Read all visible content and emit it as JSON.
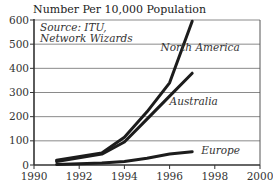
{
  "chart_data": {
    "type": "line",
    "title": "Number Per 10,000 Population",
    "source_note": [
      "Source: ITU,",
      "Network Wizards"
    ],
    "xlabel": "",
    "ylabel": "Number Per 10,000 Population",
    "xlim": [
      1990,
      2000
    ],
    "ylim": [
      0,
      600
    ],
    "x_ticks": [
      1990,
      1992,
      1994,
      1996,
      1998,
      2000
    ],
    "y_ticks": [
      0,
      100,
      200,
      300,
      400,
      500,
      600
    ],
    "grid": "horizontal",
    "legend": "inline labels",
    "series": [
      {
        "name": "North America",
        "x": [
          1991,
          1993,
          1994,
          1995,
          1996,
          1997
        ],
        "values": [
          20,
          50,
          115,
          220,
          340,
          595
        ],
        "label_pos": [
          1995.6,
          470
        ]
      },
      {
        "name": "Australia",
        "x": [
          1991,
          1993,
          1994,
          1995,
          1996,
          1997
        ],
        "values": [
          15,
          45,
          95,
          190,
          285,
          380
        ],
        "label_pos": [
          1996.0,
          250
        ]
      },
      {
        "name": "Europe",
        "x": [
          1991,
          1993,
          1994,
          1995,
          1996,
          1997
        ],
        "values": [
          2,
          8,
          15,
          28,
          45,
          55
        ],
        "label_pos": [
          1997.4,
          45
        ]
      }
    ]
  }
}
